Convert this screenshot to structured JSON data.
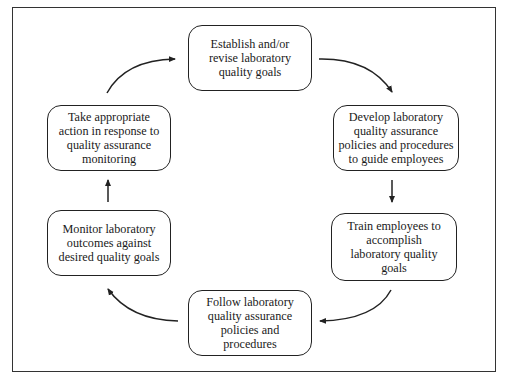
{
  "diagram": {
    "type": "cycle",
    "nodes": [
      {
        "id": "establish-goals",
        "label": "Establish and/or\nrevise laboratory\nquality goals"
      },
      {
        "id": "develop-policies",
        "label": "Develop laboratory\nquality assurance\npolicies and procedures\nto guide employees"
      },
      {
        "id": "train-employees",
        "label": "Train employees to\naccomplish\nlaboratory quality\ngoals"
      },
      {
        "id": "follow-policies",
        "label": "Follow laboratory\nquality assurance\npolicies and\nprocedures"
      },
      {
        "id": "monitor-outcomes",
        "label": "Monitor laboratory\noutcomes against\ndesired quality goals"
      },
      {
        "id": "take-action",
        "label": "Take appropriate\naction in response to\nquality assurance\nmonitoring"
      }
    ],
    "edges": [
      {
        "from": "establish-goals",
        "to": "develop-policies"
      },
      {
        "from": "develop-policies",
        "to": "train-employees"
      },
      {
        "from": "train-employees",
        "to": "follow-policies"
      },
      {
        "from": "follow-policies",
        "to": "monitor-outcomes"
      },
      {
        "from": "monitor-outcomes",
        "to": "take-action"
      },
      {
        "from": "take-action",
        "to": "establish-goals"
      }
    ],
    "colors": {
      "stroke": "#222222",
      "background": "#ffffff"
    }
  }
}
